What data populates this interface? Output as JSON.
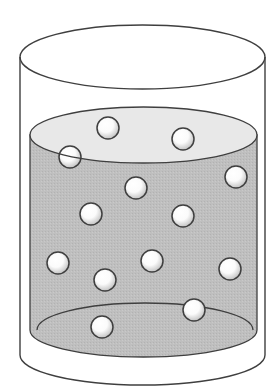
{
  "diagram": {
    "container": {
      "outline_color": "#3f3f3f",
      "background_color": "#ffffff"
    },
    "liquid": {
      "body_color": "#bfbfbf",
      "surface_color": "#e8e8e8"
    },
    "particles": {
      "count": 13,
      "fill_color": "#ffffff",
      "shade_color": "#c4c4c4",
      "outline_color": "#3f3f3f"
    }
  }
}
